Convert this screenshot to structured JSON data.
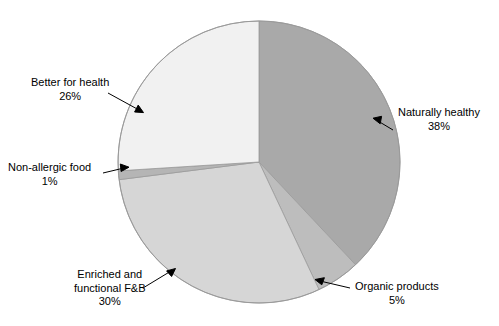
{
  "chart_data": {
    "type": "pie",
    "title": "",
    "subtitle": "",
    "xlabel": "",
    "ylabel": "",
    "legend_position": "none",
    "grid": false,
    "labels_format": "name + percent callouts with leader lines",
    "start_angle_deg": 0,
    "direction": "clockwise",
    "categories": [
      "Naturally healthy",
      "Organic products",
      "Enriched and functional F&B",
      "Non-allergic food",
      "Better for health"
    ],
    "values": [
      38,
      5,
      30,
      1,
      26
    ],
    "value_labels": [
      "38%",
      "5%",
      "30%",
      "1%",
      "26%"
    ],
    "colors": [
      "#a9a9a9",
      "#bdbdbd",
      "#d6d6d6",
      "#b5b5b5",
      "#f1f1f1"
    ],
    "slices": [
      {
        "name": "Naturally healthy",
        "value": 38,
        "value_label": "38%",
        "color": "#a9a9a9",
        "label_line1": "Naturally healthy",
        "label_line2": "38%"
      },
      {
        "name": "Organic products",
        "value": 5,
        "value_label": "5%",
        "color": "#bdbdbd",
        "label_line1": "Organic products",
        "label_line2": "5%"
      },
      {
        "name": "Enriched and functional F&B",
        "value": 30,
        "value_label": "30%",
        "color": "#d6d6d6",
        "label_line1": "Enriched and",
        "label_line2": "functional F&B",
        "label_line3": "30%"
      },
      {
        "name": "Non-allergic food",
        "value": 1,
        "value_label": "1%",
        "color": "#b5b5b5",
        "label_line1": "Non-allergic food",
        "label_line2": "1%"
      },
      {
        "name": "Better for health",
        "value": 26,
        "value_label": "26%",
        "color": "#f1f1f1",
        "label_line1": "Better for health",
        "label_line2": "26%"
      }
    ],
    "total": 100,
    "units": "percent"
  },
  "figure": {
    "background_color": "#ffffff",
    "outline_color": "#9a9a9a",
    "leader_line_color": "#000000"
  }
}
